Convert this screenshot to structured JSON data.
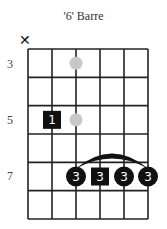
{
  "title": "'6' Barre",
  "mute_marker": "✕",
  "fret_labels": [
    {
      "label": "3",
      "y": 57
    },
    {
      "label": "5",
      "y": 113
    },
    {
      "label": "7",
      "y": 170
    }
  ],
  "grid": {
    "strings": 6,
    "rows": 6,
    "x_left": 28,
    "x_right": 148,
    "y_top": 49,
    "y_bottom": 219,
    "line_color": "#222222"
  },
  "markers": {
    "inlays": [
      {
        "string": 3,
        "row": 1,
        "color": "#c8c8c8"
      },
      {
        "string": 3,
        "row": 3,
        "color": "#c8c8c8"
      }
    ],
    "fingers": [
      {
        "string": 2,
        "row": 3,
        "finger": "1",
        "shape": "square"
      },
      {
        "string": 3,
        "row": 5,
        "finger": "3",
        "shape": "circle"
      },
      {
        "string": 4,
        "row": 5,
        "finger": "3",
        "shape": "square"
      },
      {
        "string": 5,
        "row": 5,
        "finger": "3",
        "shape": "circle"
      },
      {
        "string": 6,
        "row": 5,
        "finger": "3",
        "shape": "circle"
      }
    ],
    "barre": {
      "from_string": 3,
      "to_string": 6,
      "row": 5
    }
  }
}
